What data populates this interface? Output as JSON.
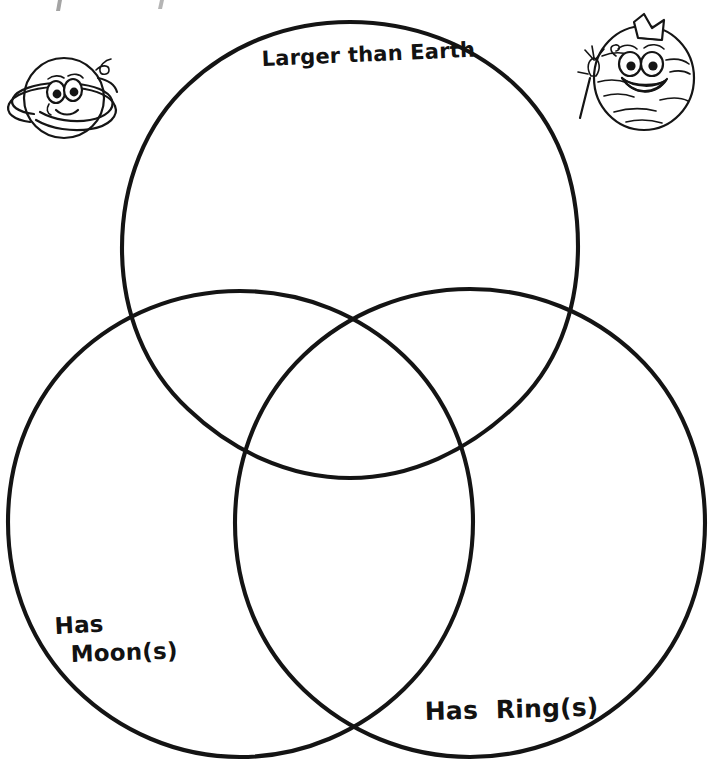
{
  "page": {
    "background_color": "#ffffff",
    "ink_color": "#141414",
    "width": 718,
    "height": 769
  },
  "diagram": {
    "type": "venn",
    "set_count": 3,
    "stroke_color": "#141414",
    "stroke_width": 4.1,
    "fill": "none",
    "circles": [
      {
        "id": "larger-than-earth",
        "label": "Larger than Earth",
        "cx": 350,
        "cy": 250,
        "r": 228,
        "label_x": 262,
        "label_y": 66
      },
      {
        "id": "has-moons",
        "label": "Has Moon(s)",
        "label_line_1": "Has",
        "label_line_2": "Moon(s)",
        "cx": 240,
        "cy": 524,
        "r": 233,
        "label_x": 55,
        "label_y": 634
      },
      {
        "id": "has-rings",
        "label": "Has Ring(s)",
        "cx": 470,
        "cy": 524,
        "r": 235,
        "label_x": 425,
        "label_y": 720
      }
    ],
    "regions": [
      {
        "id": "only-larger",
        "sets": [
          "larger-than-earth"
        ],
        "entries": []
      },
      {
        "id": "only-moons",
        "sets": [
          "has-moons"
        ],
        "entries": []
      },
      {
        "id": "only-rings",
        "sets": [
          "has-rings"
        ],
        "entries": []
      },
      {
        "id": "larger-and-moons",
        "sets": [
          "larger-than-earth",
          "has-moons"
        ],
        "entries": []
      },
      {
        "id": "larger-and-rings",
        "sets": [
          "larger-than-earth",
          "has-rings"
        ],
        "entries": []
      },
      {
        "id": "moons-and-rings",
        "sets": [
          "has-moons",
          "has-rings"
        ],
        "entries": []
      },
      {
        "id": "all-three",
        "sets": [
          "larger-than-earth",
          "has-moons",
          "has-rings"
        ],
        "entries": []
      }
    ]
  },
  "labels": {
    "top": "Larger than Earth",
    "bottom_left_line_1": "Has",
    "bottom_left_line_2": "Moon(s)",
    "bottom_right": "Has  Ring(s)"
  },
  "decorations": [
    {
      "id": "saturn-character",
      "name": "saturn-cartoon-icon",
      "description": "Smiling cartoon Saturn planet with rings and a curl on top",
      "x": 8,
      "y": 48,
      "width": 112,
      "height": 108
    },
    {
      "id": "king-planet-character",
      "name": "king-planet-cartoon-icon",
      "description": "Smiling cartoon planet wearing a crown and holding a scepter",
      "x": 578,
      "y": 14,
      "width": 120,
      "height": 120
    }
  ]
}
